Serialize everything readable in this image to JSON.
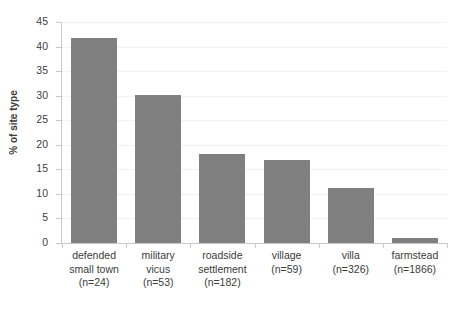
{
  "chart_data": {
    "type": "bar",
    "title": "",
    "xlabel": "",
    "ylabel": "% of site type",
    "ylim": [
      0,
      45
    ],
    "ytick_step": 5,
    "yticks": [
      45,
      40,
      35,
      30,
      25,
      20,
      15,
      10,
      5,
      0
    ],
    "grid": true,
    "legend": false,
    "bar_color": "#808080",
    "gridline_color": "#f2f2f2",
    "axis_color": "#c9c9c9",
    "categories": [
      "defended small town",
      "military vicus",
      "roadside settlement",
      "village",
      "villa",
      "farmstead"
    ],
    "category_labels": [
      [
        "defended",
        "small town",
        "(n=24)"
      ],
      [
        "military",
        "vicus",
        "(n=53)"
      ],
      [
        "roadside",
        "settlement",
        "(n=182)"
      ],
      [
        "village",
        "(n=59)"
      ],
      [
        "villa",
        "(n=326)"
      ],
      [
        "farmstead",
        "(n=1866)"
      ]
    ],
    "sample_sizes": [
      24,
      53,
      182,
      59,
      326,
      1866
    ],
    "values": [
      41.7,
      30.2,
      18.1,
      16.9,
      11.3,
      1.1
    ]
  }
}
